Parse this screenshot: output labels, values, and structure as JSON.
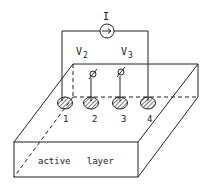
{
  "diagram": {
    "current_source_label": "I",
    "voltage_labels": [
      "V2",
      "V3"
    ],
    "voltage_subscripts": [
      "2",
      "3"
    ],
    "voltage_base": "V",
    "electrodes": [
      {
        "label": "1"
      },
      {
        "label": "2"
      },
      {
        "label": "3"
      },
      {
        "label": "4"
      }
    ],
    "layer_label": "active   layer",
    "colors": {
      "line": "#222222",
      "background": "#ffffff"
    }
  }
}
